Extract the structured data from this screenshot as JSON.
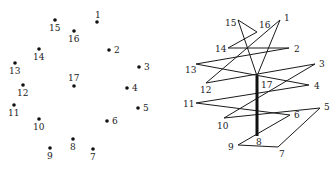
{
  "figure": {
    "left_panel": {
      "title": "Points",
      "points": [
        {
          "id": "1",
          "x": 97,
          "y": 22,
          "lx": 95,
          "ly": 18
        },
        {
          "id": "2",
          "x": 109,
          "y": 50,
          "lx": 114,
          "ly": 53
        },
        {
          "id": "3",
          "x": 139,
          "y": 67,
          "lx": 144,
          "ly": 70
        },
        {
          "id": "4",
          "x": 127,
          "y": 88,
          "lx": 132,
          "ly": 91
        },
        {
          "id": "5",
          "x": 138,
          "y": 108,
          "lx": 143,
          "ly": 111
        },
        {
          "id": "6",
          "x": 107,
          "y": 121,
          "lx": 112,
          "ly": 124
        },
        {
          "id": "7",
          "x": 93,
          "y": 149,
          "lx": 90,
          "ly": 160
        },
        {
          "id": "8",
          "x": 73,
          "y": 139,
          "lx": 70,
          "ly": 150
        },
        {
          "id": "9",
          "x": 50,
          "y": 148,
          "lx": 47,
          "ly": 159
        },
        {
          "id": "10",
          "x": 39,
          "y": 119,
          "lx": 33,
          "ly": 130
        },
        {
          "id": "11",
          "x": 14,
          "y": 105,
          "lx": 8,
          "ly": 116
        },
        {
          "id": "12",
          "x": 23,
          "y": 85,
          "lx": 17,
          "ly": 96
        },
        {
          "id": "13",
          "x": 15,
          "y": 63,
          "lx": 9,
          "ly": 74
        },
        {
          "id": "14",
          "x": 39,
          "y": 49,
          "lx": 33,
          "ly": 60
        },
        {
          "id": "15",
          "x": 55,
          "y": 20,
          "lx": 49,
          "ly": 31
        },
        {
          "id": "16",
          "x": 74,
          "y": 31,
          "lx": 68,
          "ly": 42
        },
        {
          "id": "17",
          "x": 74,
          "y": 86,
          "lx": 68,
          "ly": 81
        }
      ]
    },
    "right_panel": {
      "title": "Connected path",
      "vertices": {
        "1": {
          "x": 280,
          "y": 20,
          "lx": 284,
          "ly": 21
        },
        "2": {
          "x": 289,
          "y": 48,
          "lx": 294,
          "ly": 52
        },
        "3": {
          "x": 315,
          "y": 64,
          "lx": 319,
          "ly": 67
        },
        "4": {
          "x": 309,
          "y": 85,
          "lx": 314,
          "ly": 89
        },
        "5": {
          "x": 320,
          "y": 108,
          "lx": 324,
          "ly": 110
        },
        "6": {
          "x": 290,
          "y": 115,
          "lx": 294,
          "ly": 118
        },
        "7": {
          "x": 278,
          "y": 147,
          "lx": 279,
          "ly": 157
        },
        "8": {
          "x": 257,
          "y": 136,
          "lx": 256,
          "ly": 145
        },
        "9": {
          "x": 238,
          "y": 145,
          "lx": 228,
          "ly": 150
        },
        "10": {
          "x": 224,
          "y": 118,
          "lx": 217,
          "ly": 129
        },
        "11": {
          "x": 196,
          "y": 103,
          "lx": 183,
          "ly": 107
        },
        "12": {
          "x": 206,
          "y": 83,
          "lx": 200,
          "ly": 93
        },
        "13": {
          "x": 196,
          "y": 64,
          "lx": 185,
          "ly": 73
        },
        "14": {
          "x": 228,
          "y": 48,
          "lx": 215,
          "ly": 52
        },
        "15": {
          "x": 238,
          "y": 20,
          "lx": 225,
          "ly": 26
        },
        "16": {
          "x": 257,
          "y": 32,
          "lx": 259,
          "ly": 28
        },
        "17": {
          "x": 257,
          "y": 76,
          "lx": 261,
          "ly": 88
        }
      },
      "path": [
        "1",
        "17",
        "15",
        "16",
        "14",
        "2",
        "13",
        "4",
        "11",
        "6",
        "9",
        "7",
        "5",
        "10",
        "3",
        "12",
        "1"
      ],
      "thick_edge": [
        "17",
        "8"
      ]
    },
    "colors": {
      "background": "#ffffff",
      "ink": "#1a1a1a"
    }
  }
}
